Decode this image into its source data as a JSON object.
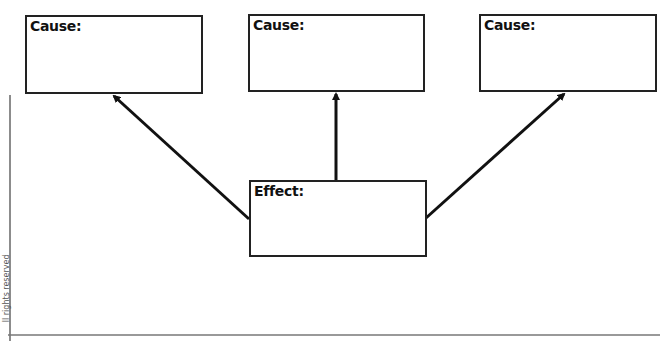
{
  "diagram": {
    "type": "cause-effect-graphic-organizer",
    "causes": [
      {
        "label": "Cause:",
        "value": ""
      },
      {
        "label": "Cause:",
        "value": ""
      },
      {
        "label": "Cause:",
        "value": ""
      }
    ],
    "effect": {
      "label": "Effect:",
      "value": ""
    },
    "margin_text": "ll rights reserved",
    "colors": {
      "stroke": "#222222",
      "background": "#ffffff",
      "rule": "#666666"
    }
  }
}
